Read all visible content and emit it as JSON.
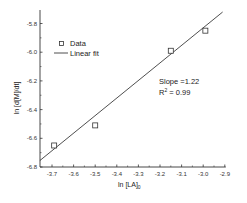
{
  "chart_data": {
    "type": "scatter",
    "title": "",
    "xlabel": "ln [LA]0",
    "xlabel_main": "ln [LA]",
    "xlabel_sub": "0",
    "ylabel": "ln [d[M]/dt]",
    "xlim": [
      -3.756,
      -2.9
    ],
    "ylim": [
      -6.8,
      -5.7
    ],
    "x_ticks": [
      -3.7,
      -3.6,
      -3.5,
      -3.4,
      -3.3,
      -3.2,
      -3.1,
      -3.0,
      -2.9
    ],
    "x_tick_labels": [
      "-3.7",
      "-3.6",
      "-3.5",
      "-3.4",
      "-3.3",
      "-3.2",
      "-3.1",
      "-3.0",
      "-2.9"
    ],
    "y_ticks": [
      -5.8,
      -6.0,
      -6.2,
      -6.4,
      -6.6,
      -6.8
    ],
    "y_tick_labels": [
      "-5.8",
      "-6.0",
      "-6.2",
      "-6.4",
      "-6.6",
      "-6.8"
    ],
    "grid": false,
    "legend_position": "upper left",
    "series": [
      {
        "name": "Data",
        "kind": "scatter",
        "marker": "open-square",
        "x": [
          -3.69,
          -3.5,
          -3.15,
          -2.99
        ],
        "y": [
          -6.65,
          -6.51,
          -5.99,
          -5.85
        ]
      },
      {
        "name": "Linear fit",
        "kind": "line",
        "x": [
          -3.756,
          -2.91
        ],
        "y": [
          -6.755,
          -5.72
        ]
      }
    ],
    "annotations": {
      "slope_text": "Slope =1.22",
      "r2_main": "R",
      "r2_sup": "2",
      "r2_value": " = 0.99"
    },
    "colors": {
      "axis": "#333333",
      "line": "#222222",
      "marker": "#333333"
    }
  }
}
